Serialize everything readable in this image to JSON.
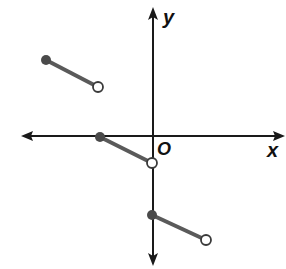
{
  "axes": {
    "x_label": "x",
    "y_label": "y",
    "origin_label": "O",
    "axis_color": "#1a1a1a"
  },
  "segment_color": "#5a5a5a",
  "point_fill_color": "#4a4a4a",
  "segments": [
    {
      "start": {
        "x": 46,
        "y": 60,
        "type": "closed"
      },
      "end": {
        "x": 98,
        "y": 87,
        "type": "open"
      }
    },
    {
      "start": {
        "x": 100,
        "y": 137,
        "type": "closed"
      },
      "end": {
        "x": 152,
        "y": 163,
        "type": "open"
      }
    },
    {
      "start": {
        "x": 152,
        "y": 215,
        "type": "closed"
      },
      "end": {
        "x": 206,
        "y": 240,
        "type": "open"
      }
    }
  ]
}
